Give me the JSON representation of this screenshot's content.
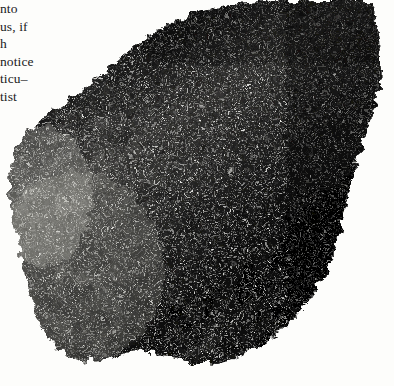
{
  "page": {
    "kind": "scanned-book-page-fragment",
    "width": 394,
    "height": 386,
    "background_color": "#fdfdfb"
  },
  "text_column": {
    "description": "Right-hand fragments of a cut-off body-text column in the left margin",
    "alignment": "left",
    "lines": [
      {
        "text": "nto"
      },
      {
        "text": "us, if"
      },
      {
        "text": "h"
      },
      {
        "text": "notice"
      },
      {
        "text": "ticu–"
      },
      {
        "text": "tist"
      }
    ]
  },
  "figure": {
    "name": "mineral-specimen-photograph",
    "orientation": "irregular wedge, widest at upper right, tapering to lower left",
    "colors": {
      "background": "#fdfdfb",
      "darkest": "#070707",
      "dark": "#1a1a1a",
      "mid": "#4a4a4a",
      "light": "#9a9a96",
      "lightest": "#d8d6cf",
      "highlight": "#f2f0ea"
    }
  }
}
